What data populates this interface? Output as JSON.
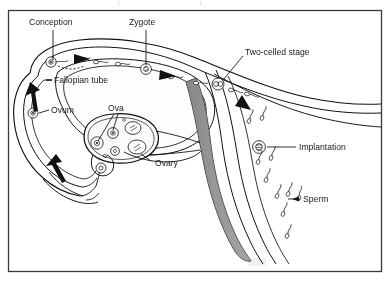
{
  "figure": {
    "type": "anatomical-diagram",
    "background_color": "#ffffff",
    "frame_color": "#3a3a3a",
    "ink_color": "#111111",
    "uterine_wall_shade": "#8f8f8f",
    "frame": {
      "x": 8,
      "y": 10,
      "width": 374,
      "height": 262
    }
  },
  "labels": {
    "conception": "Conception",
    "zygote": "Zygote",
    "two_celled_stage": "Two-celled stage",
    "fallopian_tube": "Fallopian tube",
    "ovum": "Ovum",
    "ova": "Ova",
    "ovary": "Ovary",
    "implantation": "Implantation",
    "sperm": "Sperm"
  },
  "structures": [
    {
      "name": "fallopian-tube",
      "label": "Fallopian tube"
    },
    {
      "name": "ovary",
      "label": "Ovary"
    },
    {
      "name": "uterus",
      "label": ""
    },
    {
      "name": "cervical-canal",
      "label": ""
    }
  ],
  "stages": [
    {
      "name": "conception",
      "label": "Conception",
      "marker_x": 51,
      "marker_y": 62
    },
    {
      "name": "zygote",
      "label": "Zygote",
      "marker_x": 146,
      "marker_y": 69
    },
    {
      "name": "two-celled-stage",
      "label": "Two-celled stage",
      "marker_x": 218,
      "marker_y": 84
    },
    {
      "name": "implantation",
      "label": "Implantation",
      "marker_x": 259,
      "marker_y": 147
    },
    {
      "name": "ovum",
      "label": "Ovum",
      "marker_x": 33,
      "marker_y": 113
    }
  ]
}
